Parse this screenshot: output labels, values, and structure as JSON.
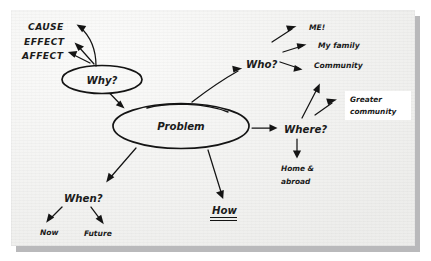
{
  "canvas": {
    "width": 431,
    "height": 261,
    "background_color": "#ffffff",
    "paper_color": "#f6f6f4",
    "shadow_color": "#b9b9bb",
    "ink_color": "#141414"
  },
  "diagram": {
    "type": "hand-drawn mind map",
    "central_node": {
      "label": "Problem",
      "shape": "ellipse"
    },
    "nodes": [
      {
        "id": "why",
        "label": "Why?",
        "shape": "ellipse"
      },
      {
        "id": "who",
        "label": "Who?",
        "shape": "text"
      },
      {
        "id": "where",
        "label": "Where?",
        "shape": "text"
      },
      {
        "id": "when",
        "label": "When?",
        "shape": "text"
      },
      {
        "id": "how",
        "label": "How",
        "shape": "text",
        "decoration": "double-underline"
      }
    ],
    "why_branch": {
      "items": [
        {
          "label": "CAUSE"
        },
        {
          "label": "EFFECT"
        },
        {
          "label": "AFFECT"
        }
      ]
    },
    "who_branch": {
      "items": [
        {
          "label": "ME!"
        },
        {
          "label": "My family"
        },
        {
          "label": "Community"
        }
      ]
    },
    "where_branch": {
      "items": [
        {
          "label": "Greater",
          "label2": "community",
          "highlight": true
        },
        {
          "label": "Home &",
          "label2": "abroad"
        }
      ]
    },
    "when_branch": {
      "items": [
        {
          "label": "Now"
        },
        {
          "label": "Future"
        }
      ]
    }
  }
}
